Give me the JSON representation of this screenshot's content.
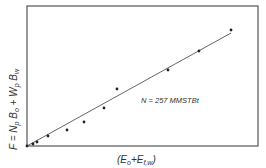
{
  "chart_data": {
    "type": "scatter",
    "title": "",
    "xlabel": "(E_o + E_f,w)",
    "ylabel": "F = N_p B_o + W_p B_w",
    "annotation": "N = 257 MMSTBt",
    "grid": false,
    "legend": null,
    "axis_ticks": "none",
    "series": [
      {
        "name": "data points",
        "points_px": [
          [
            27,
            146
          ],
          [
            33,
            144
          ],
          [
            37,
            142
          ],
          [
            48,
            136
          ],
          [
            67,
            130
          ],
          [
            84,
            122
          ],
          [
            104,
            108
          ],
          [
            117,
            89
          ],
          [
            168,
            70
          ],
          [
            199,
            51
          ],
          [
            231,
            30
          ]
        ]
      },
      {
        "name": "fit line",
        "type": "line",
        "from_px": [
          27,
          146
        ],
        "to_px": [
          231,
          33
        ]
      }
    ]
  },
  "labels": {
    "annotation": "N = 257 MMSTBt"
  },
  "colors": {
    "frame": "#555555",
    "points": "#222222",
    "line": "#555555"
  }
}
